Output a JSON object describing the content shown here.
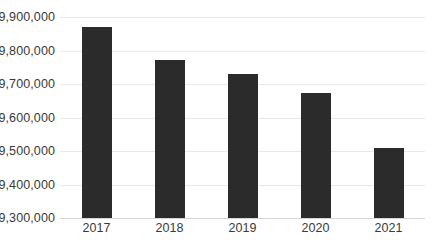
{
  "chart_data": {
    "type": "bar",
    "title": "",
    "subtitle": "",
    "xlabel": "",
    "ylabel": "",
    "categories": [
      "2017",
      "2018",
      "2019",
      "2020",
      "2021"
    ],
    "values": [
      9870000,
      9772000,
      9730000,
      9672000,
      9508000
    ],
    "series": [
      {
        "name": "",
        "values": [
          9870000,
          9772000,
          9730000,
          9672000,
          9508000
        ]
      }
    ],
    "ylim": [
      9300000,
      9900000
    ],
    "ytick_values": [
      9300000,
      9400000,
      9500000,
      9600000,
      9700000,
      9800000,
      9900000
    ],
    "ytick_labels": [
      "9,300,000",
      "9,400,000",
      "9,500,000",
      "9,600,000",
      "9,700,000",
      "9,800,000",
      "9,900,000"
    ],
    "xtick_labels": [
      "2017",
      "2018",
      "2019",
      "2020",
      "2021"
    ],
    "grid": true,
    "grid_axis": "y",
    "legend": false,
    "legend_position": "none",
    "annotations": [],
    "colors": {
      "bar": "#2b2b2b",
      "gridline": "#e9e9e9",
      "baseline": "#d6d6d6",
      "tick_label": "#3a3a3a",
      "background": "#ffffff"
    }
  }
}
